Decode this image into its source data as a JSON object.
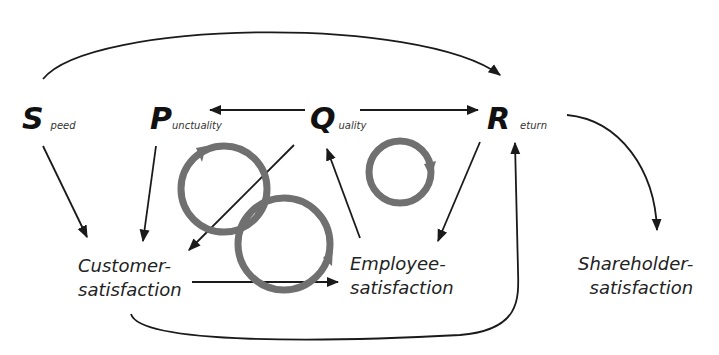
{
  "diagram": {
    "type": "causal-loop",
    "nodes": {
      "speed": {
        "initial": "S",
        "rest": "peed"
      },
      "punctuality": {
        "initial": "P",
        "rest": "unctuality"
      },
      "quality": {
        "initial": "Q",
        "rest": "uality"
      },
      "return": {
        "initial": "R",
        "rest": "eturn"
      },
      "customer": {
        "line1": "Customer-",
        "line2": "satisfaction"
      },
      "employee": {
        "line1": "Employee-",
        "line2": "satisfaction"
      },
      "shareholder": {
        "line1": "Shareholder-",
        "line2": "satisfaction"
      }
    },
    "edges": [
      {
        "from": "Speed",
        "to": "Return",
        "style": "top-arc"
      },
      {
        "from": "Quality",
        "to": "Punctuality"
      },
      {
        "from": "Quality",
        "to": "Return"
      },
      {
        "from": "Speed",
        "to": "Customer-satisfaction"
      },
      {
        "from": "Punctuality",
        "to": "Customer-satisfaction"
      },
      {
        "from": "Quality",
        "to": "Customer-satisfaction"
      },
      {
        "from": "Employee-satisfaction",
        "to": "Quality"
      },
      {
        "from": "Return",
        "to": "Employee-satisfaction"
      },
      {
        "from": "Customer-satisfaction",
        "to": "Employee-satisfaction"
      },
      {
        "from": "Customer-satisfaction",
        "to": "Return",
        "style": "bottom-arc"
      },
      {
        "from": "Return",
        "to": "Shareholder-satisfaction",
        "style": "curve"
      }
    ],
    "loops": 3,
    "colors": {
      "arrow": "#1a1a1a",
      "loop": "#707070"
    }
  }
}
